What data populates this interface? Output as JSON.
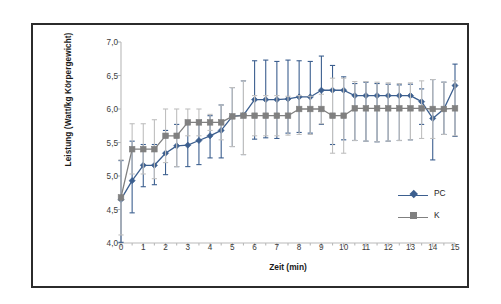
{
  "figure": {
    "border_color": "#2b2b2b",
    "background": "#ffffff"
  },
  "legend": {
    "position": "right-inside",
    "entries": [
      {
        "label": "PC",
        "color": "#3c5f8f",
        "marker": "diamond"
      },
      {
        "label": "K",
        "color": "#808080",
        "marker": "square"
      }
    ]
  },
  "chart_data": {
    "type": "line",
    "title": "",
    "xlabel": "Zeit (min)",
    "ylabel": "Leistung (Watt/kg Körpergewicht)",
    "xlim": [
      0,
      15
    ],
    "ylim": [
      4.0,
      7.0
    ],
    "grid": false,
    "errorbars": true,
    "decimal_separator": ",",
    "x_ticklabels": [
      "0",
      "1",
      "2",
      "3",
      "4",
      "5",
      "6",
      "7",
      "8",
      "9",
      "10",
      "11",
      "12",
      "13",
      "14",
      "15"
    ],
    "x_tickvalues": [
      0,
      1,
      2,
      3,
      4,
      5,
      6,
      7,
      8,
      9,
      10,
      11,
      12,
      13,
      14,
      15
    ],
    "x_minor_step": 0.5,
    "y_ticklabels": [
      "4,0",
      "4,5",
      "5,0",
      "5,5",
      "6,0",
      "6,5",
      "7,0"
    ],
    "y_tickvalues": [
      4.0,
      4.5,
      5.0,
      5.5,
      6.0,
      6.5,
      7.0
    ],
    "x": [
      0,
      0.5,
      1,
      1.5,
      2,
      2.5,
      3,
      3.5,
      4,
      4.5,
      5,
      5.5,
      6,
      6.5,
      7,
      7.5,
      8,
      8.5,
      9,
      9.5,
      10,
      10.5,
      11,
      11.5,
      12,
      12.5,
      13,
      13.5,
      14,
      14.5,
      15
    ],
    "series": [
      {
        "name": "PC",
        "color": "#3c5f8f",
        "errorbar_color": "#3c5f8f",
        "marker": "diamond",
        "values": [
          4.65,
          4.93,
          5.16,
          5.16,
          5.34,
          5.45,
          5.46,
          5.53,
          5.6,
          5.68,
          5.89,
          5.91,
          6.14,
          6.14,
          6.14,
          6.15,
          6.18,
          6.18,
          6.28,
          6.28,
          6.28,
          6.2,
          6.2,
          6.2,
          6.2,
          6.2,
          6.2,
          6.11,
          5.86,
          6.0,
          6.35
        ],
        "err_upper": [
          5.23,
          5.52,
          5.47,
          5.47,
          5.68,
          5.77,
          5.8,
          5.83,
          5.9,
          6.06,
          6.32,
          6.42,
          6.72,
          6.73,
          6.71,
          6.73,
          6.72,
          6.71,
          6.79,
          6.65,
          6.48,
          6.38,
          6.4,
          6.38,
          6.37,
          6.36,
          6.37,
          6.3,
          6.44,
          6.4,
          6.67
        ],
        "err_lower": [
          4.01,
          4.45,
          4.84,
          4.87,
          5.02,
          5.14,
          5.14,
          5.17,
          5.27,
          5.27,
          5.44,
          5.32,
          5.55,
          5.57,
          5.56,
          5.64,
          5.65,
          5.64,
          5.77,
          5.47,
          5.54,
          5.53,
          5.52,
          5.51,
          5.52,
          5.53,
          5.54,
          5.77,
          5.24,
          5.62,
          5.59
        ]
      },
      {
        "name": "K",
        "color": "#808080",
        "errorbar_color": "#bfbfbf",
        "marker": "square",
        "values": [
          4.68,
          5.4,
          5.4,
          5.4,
          5.6,
          5.6,
          5.8,
          5.8,
          5.8,
          5.8,
          5.89,
          5.9,
          5.9,
          5.9,
          5.9,
          5.9,
          6.0,
          6.0,
          6.0,
          5.9,
          5.9,
          6.01,
          6.01,
          6.01,
          6.01,
          6.01,
          6.01,
          6.01,
          6.0,
          6.0,
          6.01
        ],
        "err_upper": [
          5.24,
          5.78,
          5.78,
          5.84,
          6.0,
          6.0,
          6.0,
          6.0,
          5.92,
          6.06,
          6.32,
          6.42,
          6.2,
          6.2,
          6.2,
          6.19,
          6.2,
          6.19,
          6.22,
          6.46,
          6.46,
          6.41,
          6.41,
          6.4,
          6.39,
          6.38,
          6.39,
          6.42,
          6.44,
          6.4,
          6.42
        ],
        "err_lower": [
          4.12,
          5.03,
          5.03,
          4.96,
          5.2,
          5.14,
          5.6,
          5.6,
          5.68,
          5.54,
          5.44,
          5.32,
          5.6,
          5.6,
          5.6,
          5.61,
          5.62,
          5.62,
          5.78,
          5.34,
          5.34,
          5.53,
          5.52,
          5.51,
          5.52,
          5.53,
          5.54,
          5.56,
          5.56,
          5.62,
          5.6
        ]
      }
    ]
  }
}
